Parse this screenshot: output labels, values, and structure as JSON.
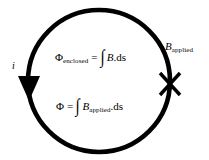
{
  "figure": {
    "background_color": "#ffffff",
    "ink_color": "#000000"
  },
  "loop": {
    "name": "current-loop-circle",
    "stroke_width_px": 4,
    "center": {
      "x": 99,
      "y": 81
    },
    "radius_px": 71
  },
  "arrow": {
    "name": "current-direction-arrowhead",
    "direction": "down",
    "position": {
      "x": 29,
      "y": 88
    }
  },
  "cross_mark": {
    "name": "field-into-page-cross",
    "glyph": "✕",
    "position": {
      "x": 170,
      "y": 84
    }
  },
  "labels": {
    "current": "i",
    "b_applied_base": "B",
    "b_applied_sub": "applied"
  },
  "equations": {
    "enclosed": {
      "lhs_base": "Φ",
      "lhs_sub": "enclosed",
      "equals": "=",
      "integral": "∫",
      "integrand_base": "B",
      "integrand_tail": ".ds"
    },
    "applied": {
      "lhs_base": "Φ",
      "equals": "=",
      "integral": "∫",
      "integrand_base": "B",
      "integrand_sub": "applied",
      "integrand_tail": ".ds"
    }
  }
}
